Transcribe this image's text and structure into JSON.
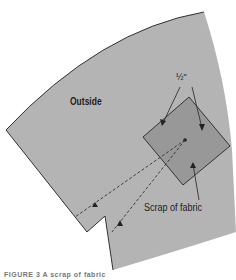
{
  "diagram": {
    "labels": {
      "outside": "Outside",
      "seam_allowance": "½\"",
      "scrap": "Scrap of fabric",
      "caption": "FIGURE 3   A scrap of fabric"
    },
    "colors": {
      "background": "#ffffff",
      "fabric_piece": "#b4b4b4",
      "scrap": "#989898",
      "outline": "#333333",
      "text": "#1e1e1e"
    }
  }
}
